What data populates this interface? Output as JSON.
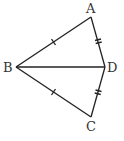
{
  "diagram": {
    "type": "geometry-figure",
    "points": [
      {
        "label": "A",
        "x": 91,
        "y": 17
      },
      {
        "label": "B",
        "x": 16,
        "y": 67
      },
      {
        "label": "C",
        "x": 91,
        "y": 117
      },
      {
        "label": "D",
        "x": 105,
        "y": 67
      }
    ],
    "segments": [
      {
        "from": "A",
        "to": "B",
        "ticks": 1
      },
      {
        "from": "B",
        "to": "C",
        "ticks": 1
      },
      {
        "from": "A",
        "to": "D",
        "ticks": 2
      },
      {
        "from": "D",
        "to": "C",
        "ticks": 2
      },
      {
        "from": "B",
        "to": "D",
        "ticks": 0
      }
    ],
    "labels": {
      "A": "A",
      "B": "B",
      "C": "C",
      "D": "D"
    },
    "stroke_color": "#222222"
  }
}
